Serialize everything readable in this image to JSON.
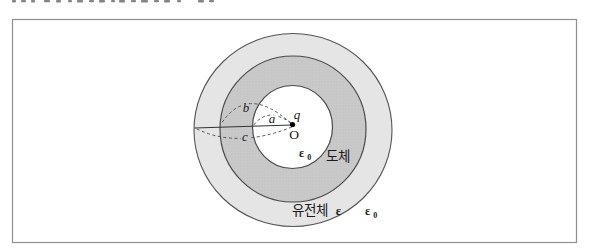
{
  "diagram": {
    "type": "physics-figure-spherical-conductor-with-dielectric",
    "center": {
      "charge_label": "q",
      "origin_label": "O"
    },
    "radii_labels": {
      "inner_cavity_radius": "a",
      "conductor_outer_radius": "b",
      "dielectric_outer_radius": "c"
    },
    "regions": {
      "cavity_permittivity": {
        "base": "ε",
        "sub": "0"
      },
      "conductor_label": "도체",
      "dielectric_label_text": "유전체",
      "dielectric_symbol": "ε",
      "outside_permittivity": {
        "base": "ε",
        "sub": "0"
      }
    },
    "colors": {
      "frame_border": "#8f8f8f",
      "dielectric_fill": "#e5e5e5",
      "conductor_fill": "#c9c9c9",
      "cavity_fill": "#ffffff",
      "outline": "#4a4a4a",
      "radius_line": "#333333",
      "label_text": "#1a1a1a"
    }
  }
}
